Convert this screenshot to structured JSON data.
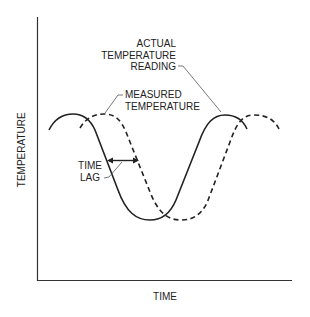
{
  "diagram": {
    "axes": {
      "x_label": "TIME",
      "y_label": "TEMPERATURE"
    },
    "annotations": {
      "actual": [
        "ACTUAL",
        "TEMPERATURE",
        "READING"
      ],
      "measured": [
        "MEASURED",
        "TEMPERATURE"
      ],
      "lag": [
        "TIME",
        "LAG"
      ]
    },
    "series": [
      {
        "name": "Actual temperature reading",
        "style": "solid"
      },
      {
        "name": "Measured temperature",
        "style": "dashed"
      }
    ],
    "colors": {
      "line": "#222222",
      "leader": "#555555",
      "background": "#ffffff"
    }
  }
}
